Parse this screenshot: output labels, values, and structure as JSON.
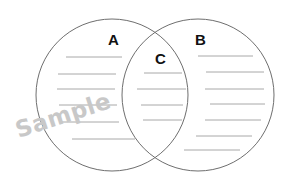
{
  "diagram": {
    "type": "venn",
    "regions": [
      {
        "id": "A",
        "label": "A",
        "lines": 6
      },
      {
        "id": "B",
        "label": "B",
        "lines": 7
      },
      {
        "id": "C",
        "label": "C",
        "lines": 4
      }
    ],
    "colors": {
      "outline": "#6e6e6e",
      "line": "#a8a8a8",
      "label": "#111111",
      "watermark": "#c8c8c8",
      "background": "#ffffff"
    }
  },
  "labels": {
    "a": "A",
    "b": "B",
    "c": "C"
  },
  "watermark": "Sample"
}
